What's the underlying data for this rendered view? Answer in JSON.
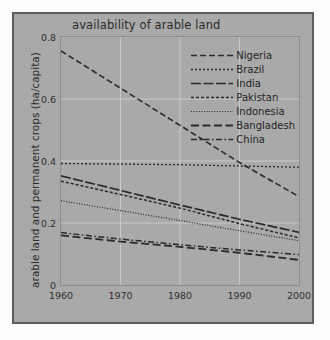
{
  "chart_data": {
    "type": "line",
    "title": "availability of arable land",
    "xlabel": "",
    "ylabel": "arable land and permanent crops (ha/capita)",
    "xlim": [
      1960,
      2000
    ],
    "ylim": [
      0,
      0.8
    ],
    "xticks": [
      "1960",
      "1970",
      "1980",
      "1990",
      "2000"
    ],
    "yticks": [
      "0",
      "0.2",
      "0.4",
      "0.6",
      "0.8"
    ],
    "grid": true,
    "legend_position": "upper right",
    "x": [
      1960,
      1970,
      1980,
      1990,
      2000
    ],
    "series": [
      {
        "name": "Nigeria",
        "values": [
          0.755,
          0.635,
          0.515,
          0.395,
          0.285
        ],
        "dash": "long-dash",
        "width": 1.6
      },
      {
        "name": "Brazil",
        "values": [
          0.392,
          0.39,
          0.388,
          0.384,
          0.38
        ],
        "dash": "fine-dash",
        "width": 1.3
      },
      {
        "name": "India",
        "values": [
          0.352,
          0.305,
          0.258,
          0.212,
          0.17
        ],
        "dash": "solid-dash",
        "width": 1.7
      },
      {
        "name": "Pakistan",
        "values": [
          0.335,
          0.292,
          0.248,
          0.198,
          0.152
        ],
        "dash": "short-dash",
        "width": 1.5
      },
      {
        "name": "Indonesia",
        "values": [
          0.272,
          0.24,
          0.208,
          0.175,
          0.143
        ],
        "dash": "dotted",
        "width": 1.2
      },
      {
        "name": "Bangladesh",
        "values": [
          0.16,
          0.14,
          0.123,
          0.104,
          0.081
        ],
        "dash": "dash-long",
        "width": 1.8
      },
      {
        "name": "China",
        "values": [
          0.169,
          0.148,
          0.13,
          0.113,
          0.098
        ],
        "dash": "dash-dot",
        "width": 1.5
      }
    ],
    "colors": {
      "panel_background": "#a9a9a9",
      "panel_border": "#5d5d5d",
      "plot_background": "#a9a9a9",
      "gridline": "#c9c9c9",
      "axis_border": "#8d8d8d",
      "line": "#2a2a2a",
      "text": "#2b2b2b",
      "page_background": "#fdfdfd"
    }
  }
}
